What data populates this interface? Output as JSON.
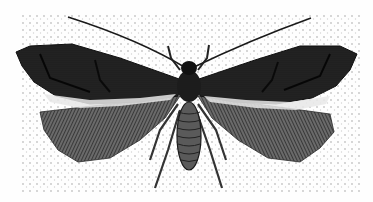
{
  "image": {
    "subject": "moth illustration",
    "style": "engraving, black and white, stippled background",
    "width": 373,
    "height": 202,
    "colors": {
      "background": "#fefefe",
      "stipple": "#c8c8c8",
      "ink_dark": "#141414",
      "ink_mid": "#4a4a4a",
      "ink_light": "#9a9a9a"
    }
  }
}
